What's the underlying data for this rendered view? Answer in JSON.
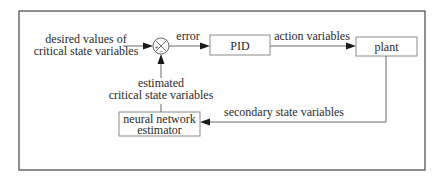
{
  "diagram": {
    "type": "control-loop block diagram",
    "input_label": {
      "line1": "desired values of",
      "line2": "critical state variables"
    },
    "summing_junction": {
      "plus_sign": "+",
      "minus_sign": "−"
    },
    "edges": {
      "error": "error",
      "action": "action variables",
      "secondary": "secondary state variables",
      "estimated": {
        "line1": "estimated",
        "line2": "critical state variables"
      }
    },
    "blocks": {
      "pid": "PID",
      "plant": "plant",
      "estimator": {
        "line1": "neural network",
        "line2": "estimator"
      }
    },
    "colors": {
      "frame": "#555555",
      "box_border": "#8a8a8a",
      "arrowhead": "#1a1a1a",
      "text": "#2a2a2a"
    }
  }
}
